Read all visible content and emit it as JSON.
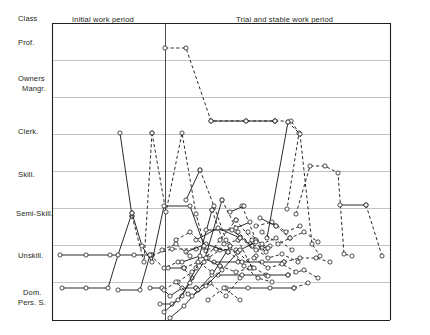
{
  "axis": {
    "header": "Class",
    "categories": [
      {
        "label": "Prof.",
        "y": 42
      },
      {
        "label": "Owners",
        "y": 79
      },
      {
        "label": "Mangr.",
        "y": 89
      },
      {
        "label": "Clerk.",
        "y": 131
      },
      {
        "label": "Skill.",
        "y": 174
      },
      {
        "label": "Semi-Skill.",
        "y": 213
      },
      {
        "label": "Unskill.",
        "y": 255
      },
      {
        "label": "Dom.",
        "y": 293
      },
      {
        "label": "Pers. S.",
        "y": 303
      }
    ]
  },
  "periods": [
    {
      "label": "Initial work period",
      "x": 72,
      "y": 21
    },
    {
      "label": "Trial and stable work period",
      "x": 236,
      "y": 21
    }
  ],
  "chart_data": {
    "type": "line",
    "title": "",
    "xlabel": "",
    "ylabel": "Class",
    "grid": true,
    "legend_position": "none",
    "ylim": [
      0,
      8
    ],
    "y_categories": [
      "Dom. Pers. S.",
      "Unskill.",
      "Semi-Skill.",
      "Skill.",
      "Clerk.",
      "Owners Mangr.",
      "Prof."
    ],
    "y_gridline_px": [
      23,
      60,
      97,
      134,
      171,
      208,
      245,
      282,
      320
    ],
    "x_divider_px": 165,
    "plot_box_px": {
      "left": 52,
      "top": 23,
      "right": 390,
      "bottom": 320
    },
    "note": "Occupational-class career trajectories; solid segments = initial work period style, dashed segments = trial/stable work period style; open circles mark job changes.",
    "series": [
      {
        "name": "t1",
        "style": "dash",
        "points": [
          [
            165,
            48
          ],
          [
            186,
            48
          ],
          [
            211,
            121
          ],
          [
            246,
            121
          ],
          [
            275,
            121
          ]
        ]
      },
      {
        "name": "t1b",
        "style": "solid",
        "points": [
          [
            211,
            121
          ],
          [
            246,
            121
          ],
          [
            275,
            121
          ]
        ]
      },
      {
        "name": "t2",
        "style": "dash",
        "points": [
          [
            275,
            121
          ],
          [
            291,
            121
          ],
          [
            299,
            133
          ],
          [
            287,
            209
          ]
        ]
      },
      {
        "name": "t3",
        "style": "solid",
        "points": [
          [
            267,
            238
          ],
          [
            288,
            122
          ]
        ]
      },
      {
        "name": "t4",
        "style": "dash",
        "points": [
          [
            288,
            122
          ],
          [
            300,
            134
          ],
          [
            312,
            244
          ],
          [
            320,
            256
          ]
        ]
      },
      {
        "name": "t5",
        "style": "dash",
        "points": [
          [
            296,
            214
          ],
          [
            310,
            166
          ],
          [
            325,
            166
          ],
          [
            338,
            173
          ],
          [
            344,
            254
          ],
          [
            352,
            256
          ]
        ]
      },
      {
        "name": "t6",
        "style": "solid",
        "points": [
          [
            340,
            205
          ],
          [
            366,
            205
          ]
        ]
      },
      {
        "name": "t7",
        "style": "dash",
        "points": [
          [
            366,
            205
          ],
          [
            382,
            256
          ]
        ]
      },
      {
        "name": "t8",
        "style": "solid",
        "points": [
          [
            120,
            133
          ],
          [
            132,
            216
          ]
        ]
      },
      {
        "name": "t9",
        "style": "dash",
        "points": [
          [
            132,
            216
          ],
          [
            144,
            262
          ],
          [
            152,
            133
          ]
        ]
      },
      {
        "name": "t10",
        "style": "dash",
        "points": [
          [
            152,
            133
          ],
          [
            166,
            212
          ],
          [
            182,
            133
          ],
          [
            196,
            214
          ],
          [
            208,
            258
          ],
          [
            220,
            250
          ]
        ]
      },
      {
        "name": "t11",
        "style": "solid",
        "points": [
          [
            60,
            255
          ],
          [
            86,
            255
          ],
          [
            110,
            255
          ],
          [
            134,
            255
          ],
          [
            152,
            255
          ]
        ]
      },
      {
        "name": "t12",
        "style": "dash",
        "points": [
          [
            152,
            255
          ],
          [
            172,
            249
          ],
          [
            196,
            249
          ],
          [
            216,
            249
          ],
          [
            236,
            250
          ]
        ]
      },
      {
        "name": "t13",
        "style": "solid",
        "points": [
          [
            62,
            288
          ],
          [
            86,
            288
          ],
          [
            108,
            288
          ],
          [
            118,
            255
          ],
          [
            132,
            213
          ]
        ]
      },
      {
        "name": "t14",
        "style": "solid",
        "points": [
          [
            132,
            213
          ],
          [
            142,
            246
          ],
          [
            152,
            262
          ],
          [
            164,
            206
          ],
          [
            190,
            206
          ],
          [
            206,
            251
          ]
        ]
      },
      {
        "name": "t15",
        "style": "solid",
        "points": [
          [
            118,
            290
          ],
          [
            140,
            290
          ],
          [
            150,
            255
          ]
        ]
      },
      {
        "name": "t16",
        "style": "dash",
        "points": [
          [
            150,
            255
          ],
          [
            164,
            268
          ],
          [
            178,
            262
          ],
          [
            192,
            278
          ]
        ]
      },
      {
        "name": "t17",
        "style": "solid",
        "points": [
          [
            150,
            288
          ],
          [
            162,
            288
          ],
          [
            170,
            296
          ],
          [
            182,
            288
          ],
          [
            196,
            288
          ]
        ]
      },
      {
        "name": "t18",
        "style": "dash",
        "points": [
          [
            196,
            288
          ],
          [
            210,
            283
          ],
          [
            226,
            296
          ],
          [
            240,
            278
          ]
        ]
      },
      {
        "name": "t19",
        "style": "solid",
        "points": [
          [
            160,
            304
          ],
          [
            172,
            304
          ],
          [
            182,
            296
          ],
          [
            196,
            268
          ],
          [
            212,
            210
          ]
        ]
      },
      {
        "name": "t20",
        "style": "dash",
        "points": [
          [
            212,
            210
          ],
          [
            224,
            244
          ],
          [
            238,
            240
          ],
          [
            252,
            268
          ]
        ]
      },
      {
        "name": "t21",
        "style": "solid",
        "points": [
          [
            164,
            312
          ],
          [
            178,
            300
          ],
          [
            190,
            283
          ],
          [
            204,
            262
          ],
          [
            222,
            200
          ]
        ]
      },
      {
        "name": "t22",
        "style": "dash",
        "points": [
          [
            222,
            200
          ],
          [
            238,
            232
          ],
          [
            250,
            244
          ],
          [
            262,
            248
          ]
        ]
      },
      {
        "name": "t23",
        "style": "solid",
        "points": [
          [
            170,
            318
          ],
          [
            184,
            306
          ],
          [
            198,
            290
          ],
          [
            212,
            275
          ],
          [
            230,
            246
          ]
        ]
      },
      {
        "name": "t24",
        "style": "dash",
        "points": [
          [
            230,
            246
          ],
          [
            244,
            266
          ],
          [
            258,
            278
          ],
          [
            272,
            282
          ]
        ]
      },
      {
        "name": "t25",
        "style": "solid",
        "points": [
          [
            214,
            262
          ],
          [
            238,
            262
          ],
          [
            262,
            262
          ],
          [
            284,
            262
          ]
        ]
      },
      {
        "name": "t26",
        "style": "dash",
        "points": [
          [
            284,
            262
          ],
          [
            300,
            258
          ],
          [
            316,
            258
          ],
          [
            330,
            262
          ]
        ]
      },
      {
        "name": "t27",
        "style": "solid",
        "points": [
          [
            218,
            275
          ],
          [
            242,
            275
          ],
          [
            266,
            275
          ],
          [
            288,
            275
          ]
        ]
      },
      {
        "name": "t28",
        "style": "dash",
        "points": [
          [
            288,
            275
          ],
          [
            304,
            270
          ],
          [
            318,
            278
          ]
        ]
      },
      {
        "name": "t29",
        "style": "solid",
        "points": [
          [
            226,
            288
          ],
          [
            248,
            288
          ],
          [
            270,
            288
          ],
          [
            294,
            288
          ]
        ]
      },
      {
        "name": "t30",
        "style": "dash",
        "points": [
          [
            294,
            288
          ],
          [
            308,
            283
          ]
        ]
      },
      {
        "name": "t31",
        "style": "solid",
        "points": [
          [
            206,
            230
          ],
          [
            232,
            230
          ],
          [
            252,
            246
          ]
        ]
      },
      {
        "name": "t32",
        "style": "dash",
        "points": [
          [
            252,
            246
          ],
          [
            268,
            258
          ],
          [
            282,
            254
          ],
          [
            298,
            262
          ]
        ]
      },
      {
        "name": "t33",
        "style": "solid",
        "points": [
          [
            196,
            240
          ],
          [
            218,
            228
          ],
          [
            240,
            238
          ]
        ]
      },
      {
        "name": "t34",
        "style": "dash",
        "points": [
          [
            240,
            238
          ],
          [
            256,
            250
          ],
          [
            270,
            246
          ]
        ]
      },
      {
        "name": "t35",
        "style": "solid",
        "points": [
          [
            186,
            252
          ],
          [
            206,
            244
          ],
          [
            228,
            252
          ]
        ]
      },
      {
        "name": "t36",
        "style": "dash",
        "points": [
          [
            228,
            252
          ],
          [
            242,
            262
          ],
          [
            256,
            256
          ]
        ]
      },
      {
        "name": "t37",
        "style": "solid",
        "points": [
          [
            182,
            262
          ],
          [
            200,
            256
          ],
          [
            220,
            266
          ]
        ]
      },
      {
        "name": "t38",
        "style": "dash",
        "points": [
          [
            220,
            266
          ],
          [
            236,
            272
          ],
          [
            250,
            268
          ]
        ]
      },
      {
        "name": "t39",
        "style": "dash",
        "points": [
          [
            178,
            282
          ],
          [
            192,
            272
          ],
          [
            206,
            258
          ],
          [
            220,
            240
          ],
          [
            236,
            220
          ]
        ]
      },
      {
        "name": "t40",
        "style": "dash",
        "points": [
          [
            236,
            220
          ],
          [
            252,
            240
          ],
          [
            266,
            252
          ]
        ]
      },
      {
        "name": "t41",
        "style": "solid",
        "points": [
          [
            192,
            296
          ],
          [
            206,
            286
          ],
          [
            222,
            270
          ],
          [
            238,
            252
          ]
        ]
      },
      {
        "name": "t42",
        "style": "dash",
        "points": [
          [
            238,
            252
          ],
          [
            254,
            268
          ],
          [
            268,
            276
          ]
        ]
      },
      {
        "name": "t43",
        "style": "dash",
        "points": [
          [
            242,
            206
          ],
          [
            256,
            240
          ],
          [
            268,
            248
          ]
        ]
      },
      {
        "name": "t44",
        "style": "solid",
        "points": [
          [
            230,
            212
          ],
          [
            244,
            206
          ]
        ]
      },
      {
        "name": "t45",
        "style": "dash",
        "points": [
          [
            248,
            232
          ],
          [
            262,
            244
          ],
          [
            276,
            238
          ],
          [
            292,
            250
          ]
        ]
      },
      {
        "name": "t46",
        "style": "solid",
        "points": [
          [
            236,
            228
          ],
          [
            250,
            222
          ]
        ]
      },
      {
        "name": "t47",
        "style": "dash",
        "points": [
          [
            262,
            232
          ],
          [
            278,
            244
          ],
          [
            290,
            238
          ]
        ]
      },
      {
        "name": "t48",
        "style": "dash",
        "points": [
          [
            256,
            226
          ],
          [
            272,
            222
          ],
          [
            286,
            232
          ],
          [
            300,
            226
          ]
        ]
      },
      {
        "name": "t49",
        "style": "dash",
        "points": [
          [
            208,
            300
          ],
          [
            224,
            288
          ],
          [
            240,
            300
          ]
        ]
      },
      {
        "name": "t50",
        "style": "solid",
        "points": [
          [
            168,
            268
          ],
          [
            184,
            268
          ]
        ]
      },
      {
        "name": "t51",
        "style": "dash",
        "points": [
          [
            184,
            268
          ],
          [
            198,
            262
          ],
          [
            212,
            272
          ]
        ]
      },
      {
        "name": "t52",
        "style": "dash",
        "points": [
          [
            200,
            170
          ],
          [
            214,
            206
          ],
          [
            226,
            240
          ]
        ]
      },
      {
        "name": "t53",
        "style": "solid",
        "points": [
          [
            186,
            200
          ],
          [
            200,
            170
          ]
        ]
      },
      {
        "name": "t54",
        "style": "dash",
        "points": [
          [
            176,
            240
          ],
          [
            190,
            232
          ],
          [
            204,
            246
          ]
        ]
      },
      {
        "name": "t55",
        "style": "dash",
        "points": [
          [
            162,
            250
          ],
          [
            176,
            244
          ],
          [
            190,
            256
          ]
        ]
      },
      {
        "name": "t56",
        "style": "dash",
        "points": [
          [
            164,
            290
          ],
          [
            176,
            282
          ],
          [
            188,
            294
          ]
        ]
      },
      {
        "name": "t57",
        "style": "dash",
        "points": [
          [
            254,
            258
          ],
          [
            268,
            268
          ],
          [
            282,
            264
          ],
          [
            296,
            272
          ]
        ]
      },
      {
        "name": "t58",
        "style": "solid",
        "points": [
          [
            240,
            250
          ],
          [
            256,
            242
          ]
        ]
      },
      {
        "name": "t59",
        "style": "dash",
        "points": [
          [
            276,
            226
          ],
          [
            290,
            238
          ],
          [
            304,
            232
          ],
          [
            318,
            242
          ]
        ]
      },
      {
        "name": "t60",
        "style": "solid",
        "points": [
          [
            260,
            218
          ],
          [
            276,
            226
          ]
        ]
      }
    ]
  }
}
